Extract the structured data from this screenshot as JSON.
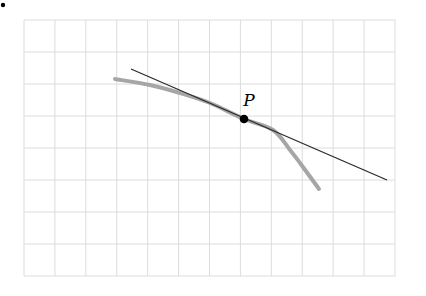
{
  "figure": {
    "point_label": "P",
    "colors": {
      "grid": "#dcdcdc",
      "curve": "#a6a6a6",
      "tangent": "#2a2a2a",
      "point": "#000000",
      "background": "#ffffff"
    },
    "grid": {
      "x0": 24,
      "y0": 20,
      "x1": 395,
      "y1": 276,
      "cols": 12,
      "rows": 8
    },
    "curve_points": [
      [
        115,
        79
      ],
      [
        150,
        85
      ],
      [
        180,
        93
      ],
      [
        210,
        103
      ],
      [
        244,
        119
      ],
      [
        273,
        130
      ],
      [
        290,
        150
      ],
      [
        300,
        163
      ],
      [
        319,
        189
      ]
    ],
    "tangent_line": {
      "x1": 131,
      "y1": 69,
      "x2": 387,
      "y2": 180
    },
    "point": {
      "x": 244,
      "y": 119,
      "label_x": 244,
      "label_y": 106
    }
  }
}
